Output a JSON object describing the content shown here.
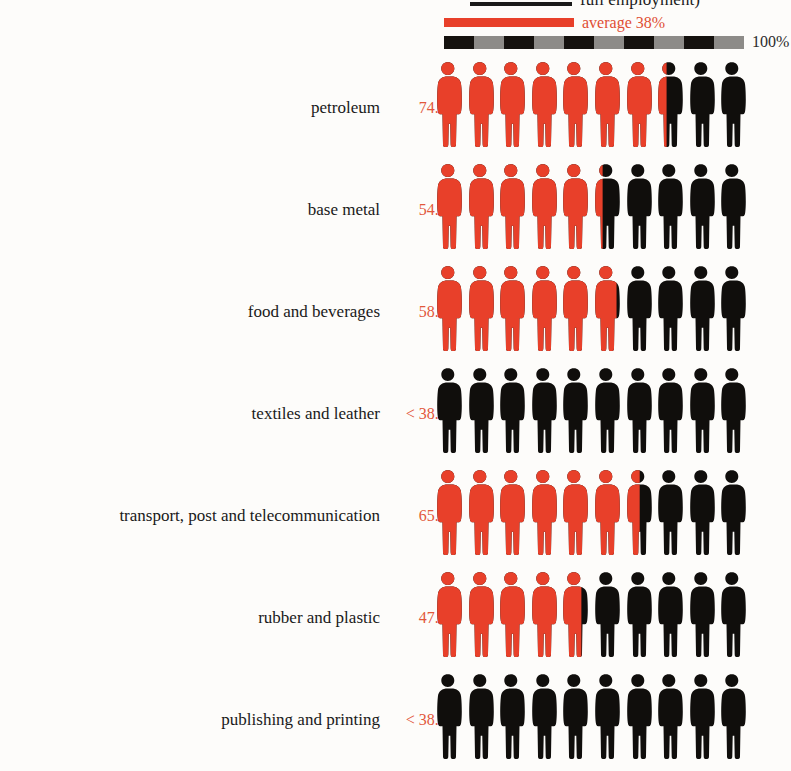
{
  "legend": {
    "top_text": "full employment)",
    "average_label": "average 38%",
    "scale_max_label": "100%",
    "average_swatch_name": "average-swatch"
  },
  "colors": {
    "filled": "#e8402a",
    "unfilled": "#100e0c",
    "value_text": "#e2573b",
    "label_text": "#191919",
    "background": "#fdfcfa",
    "scale_dark": "#15120f",
    "scale_light": "#8d8b88"
  },
  "chart_data": {
    "type": "bar",
    "title": "full employment)",
    "subtitle": "average 38%",
    "xlabel": "",
    "ylabel": "",
    "xlim": [
      0,
      100
    ],
    "grid": false,
    "legend_position": "top",
    "units": "percent",
    "pictogram": {
      "icon": "person",
      "icons_per_row": 10,
      "value_per_icon": 10,
      "filled_color": "#e8402a",
      "unfilled_color": "#100e0c"
    },
    "reference_line": {
      "label": "average 38%",
      "value": 38
    },
    "axis_labels": [
      "100%"
    ],
    "categories": [
      "petroleum",
      "base metal",
      "food and beverages",
      "textiles and leather",
      "transport, post and telecommunication",
      "rubber and plastic",
      "publishing and printing"
    ],
    "values": [
      74.3,
      54.0,
      58.4,
      38.0,
      65.6,
      47.4,
      38.0
    ],
    "value_labels": [
      "74.3%",
      "54.0%",
      "58.4%",
      "< 38.0%",
      "65.6%",
      "47.4%",
      "< 38.0%"
    ]
  },
  "rows": [
    {
      "label": "petroleum",
      "value_label": "74.3%",
      "fill": 74.3
    },
    {
      "label": "base metal",
      "value_label": "54.0%",
      "fill": 54.0
    },
    {
      "label": "food and beverages",
      "value_label": "58.4%",
      "fill": 58.4
    },
    {
      "label": "textiles and leather",
      "value_label": "< 38.0%",
      "fill": 0
    },
    {
      "label": "transport, post and telecommunication",
      "value_label": "65.6%",
      "fill": 65.6
    },
    {
      "label": "rubber and plastic",
      "value_label": "47.4%",
      "fill": 47.4
    },
    {
      "label": "publishing and printing",
      "value_label": "< 38.0%",
      "fill": 0
    }
  ],
  "scalebar": {
    "segments": [
      "dark",
      "light",
      "dark",
      "light",
      "dark",
      "light",
      "dark",
      "light",
      "dark",
      "light"
    ]
  }
}
